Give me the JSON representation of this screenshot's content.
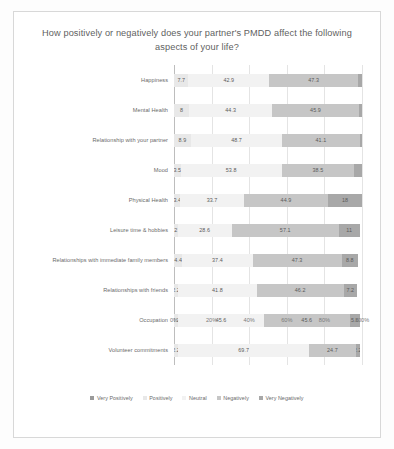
{
  "chart_data": {
    "type": "bar",
    "subtype": "stacked-horizontal-100",
    "title": "How positively or negatively does your partner's PMDD affect the following aspects of your life?",
    "xlabel": "",
    "ylabel": "",
    "xlim": [
      0,
      100
    ],
    "grid": true,
    "legend_position": "bottom",
    "xticks": [
      "0%",
      "20%",
      "40%",
      "60%",
      "80%",
      "100%"
    ],
    "xtick_values": [
      0,
      20,
      40,
      60,
      80,
      100
    ],
    "categories": [
      "Happiness",
      "Mental Health",
      "Relationship with your partner",
      "Mood",
      "Physical Health",
      "Leisure time & hobbies",
      "Relationships with immediate family members",
      "Relationships with friends",
      "Occupation",
      "Volunteer commitments"
    ],
    "series": [
      {
        "name": "Very Positively",
        "color": "#9a9a9a",
        "values": [
          0,
          0,
          0,
          0,
          0,
          0,
          0,
          0,
          0,
          0
        ]
      },
      {
        "name": "Positively",
        "color": "#e8e8e8",
        "values": [
          7.7,
          8,
          8.9,
          3.5,
          3.4,
          2,
          4.4,
          2.2,
          2.2,
          2.2
        ]
      },
      {
        "name": "Neutral",
        "color": "#f2f2f2",
        "values": [
          42.9,
          44.3,
          48.7,
          53.8,
          33.7,
          28.6,
          37.4,
          41.8,
          45.6,
          69.7
        ]
      },
      {
        "name": "Negatively",
        "color": "#c6c6c6",
        "values": [
          47.3,
          45.9,
          41.1,
          38.5,
          44.9,
          57.1,
          47.3,
          46.2,
          45.6,
          24.7
        ]
      },
      {
        "name": "Very Negatively",
        "color": "#a8a8a8",
        "values": [
          2.1,
          1.8,
          1.3,
          4.2,
          18,
          11,
          8.8,
          7.2,
          5.6,
          2.2
        ]
      }
    ],
    "data_labels": [
      {
        "category": "Happiness",
        "labels": [
          "7.7",
          "42.9",
          "47.3"
        ]
      },
      {
        "category": "Mental Health",
        "labels": [
          "8",
          "44.3",
          "45.9"
        ]
      },
      {
        "category": "Relationship with your partner",
        "labels": [
          "8.9",
          "48.7",
          "41.1"
        ]
      },
      {
        "category": "Mood",
        "labels": [
          "3.5",
          "53.8",
          "38.5"
        ]
      },
      {
        "category": "Physical Health",
        "labels": [
          "3.4",
          "33.7",
          "44.9",
          "18"
        ]
      },
      {
        "category": "Leisure time & hobbies",
        "labels": [
          "2",
          "28.6",
          "57.1",
          "11"
        ]
      },
      {
        "category": "Relationships with immediate family members",
        "labels": [
          "4.4",
          "37.4",
          "47.3",
          "8.8"
        ]
      },
      {
        "category": "Relationships with friends",
        "labels": [
          "2.2",
          "41.8",
          "46.2",
          "7.2"
        ]
      },
      {
        "category": "Occupation",
        "labels": [
          "2.2",
          "45.6",
          "45.6",
          "5.6"
        ]
      },
      {
        "category": "Volunteer commitments",
        "labels": [
          "2.2",
          "69.7",
          "24.7",
          "2.2"
        ]
      }
    ],
    "rows": [
      {
        "label": "Happiness",
        "segments": [
          {
            "series": "Positively",
            "value": 7.7,
            "label": "7.7",
            "cls": "seg1"
          },
          {
            "series": "Neutral",
            "value": 42.9,
            "label": "42.9",
            "cls": "seg2"
          },
          {
            "series": "Negatively",
            "value": 47.3,
            "label": "47.3",
            "cls": "seg3"
          },
          {
            "series": "Very Negatively",
            "value": 2.1,
            "label": "",
            "cls": "seg4"
          }
        ]
      },
      {
        "label": "Mental Health",
        "segments": [
          {
            "series": "Positively",
            "value": 8,
            "label": "8",
            "cls": "seg1"
          },
          {
            "series": "Neutral",
            "value": 44.3,
            "label": "44.3",
            "cls": "seg2"
          },
          {
            "series": "Negatively",
            "value": 45.9,
            "label": "45.9",
            "cls": "seg3"
          },
          {
            "series": "Very Negatively",
            "value": 1.8,
            "label": "",
            "cls": "seg4"
          }
        ]
      },
      {
        "label": "Relationship with your partner",
        "segments": [
          {
            "series": "Positively",
            "value": 8.9,
            "label": "8.9",
            "cls": "seg1"
          },
          {
            "series": "Neutral",
            "value": 48.7,
            "label": "48.7",
            "cls": "seg2"
          },
          {
            "series": "Negatively",
            "value": 41.1,
            "label": "41.1",
            "cls": "seg3"
          },
          {
            "series": "Very Negatively",
            "value": 1.3,
            "label": "",
            "cls": "seg4"
          }
        ]
      },
      {
        "label": "Mood",
        "segments": [
          {
            "series": "Positively",
            "value": 3.5,
            "label": "3.5",
            "cls": "seg1"
          },
          {
            "series": "Neutral",
            "value": 53.8,
            "label": "53.8",
            "cls": "seg2"
          },
          {
            "series": "Negatively",
            "value": 38.5,
            "label": "38.5",
            "cls": "seg3"
          },
          {
            "series": "Very Negatively",
            "value": 4.2,
            "label": "",
            "cls": "seg4"
          }
        ]
      },
      {
        "label": "Physical Health",
        "segments": [
          {
            "series": "Positively",
            "value": 3.4,
            "label": "3.4",
            "cls": "seg1"
          },
          {
            "series": "Neutral",
            "value": 33.7,
            "label": "33.7",
            "cls": "seg2"
          },
          {
            "series": "Negatively",
            "value": 44.9,
            "label": "44.9",
            "cls": "seg3"
          },
          {
            "series": "Very Negatively",
            "value": 18,
            "label": "18",
            "cls": "seg4"
          }
        ]
      },
      {
        "label": "Leisure time & hobbies",
        "segments": [
          {
            "series": "Positively",
            "value": 2,
            "label": "2",
            "cls": "seg1"
          },
          {
            "series": "Neutral",
            "value": 28.6,
            "label": "28.6",
            "cls": "seg2"
          },
          {
            "series": "Negatively",
            "value": 57.1,
            "label": "57.1",
            "cls": "seg3"
          },
          {
            "series": "Very Negatively",
            "value": 11,
            "label": "11",
            "cls": "seg4"
          }
        ]
      },
      {
        "label": "Relationships with immediate family members",
        "segments": [
          {
            "series": "Positively",
            "value": 4.4,
            "label": "4.4",
            "cls": "seg1"
          },
          {
            "series": "Neutral",
            "value": 37.4,
            "label": "37.4",
            "cls": "seg2"
          },
          {
            "series": "Negatively",
            "value": 47.3,
            "label": "47.3",
            "cls": "seg3"
          },
          {
            "series": "Very Negatively",
            "value": 8.8,
            "label": "8.8",
            "cls": "seg4"
          }
        ]
      },
      {
        "label": "Relationships with friends",
        "segments": [
          {
            "series": "Positively",
            "value": 2.2,
            "label": "2.2",
            "cls": "seg1"
          },
          {
            "series": "Neutral",
            "value": 41.8,
            "label": "41.8",
            "cls": "seg2"
          },
          {
            "series": "Negatively",
            "value": 46.2,
            "label": "46.2",
            "cls": "seg3"
          },
          {
            "series": "Very Negatively",
            "value": 7.2,
            "label": "7.2",
            "cls": "seg4"
          }
        ]
      },
      {
        "label": "Occupation",
        "segments": [
          {
            "series": "Positively",
            "value": 2.2,
            "label": "2.2",
            "cls": "seg1"
          },
          {
            "series": "Neutral",
            "value": 45.6,
            "label": "45.6",
            "cls": "seg2"
          },
          {
            "series": "Negatively",
            "value": 45.6,
            "label": "45.6",
            "cls": "seg3"
          },
          {
            "series": "Very Negatively",
            "value": 5.6,
            "label": "5.6",
            "cls": "seg4"
          }
        ]
      },
      {
        "label": "Volunteer commitments",
        "segments": [
          {
            "series": "Positively",
            "value": 2.2,
            "label": "2.2",
            "cls": "seg1"
          },
          {
            "series": "Neutral",
            "value": 69.7,
            "label": "69.7",
            "cls": "seg2"
          },
          {
            "series": "Negatively",
            "value": 24.7,
            "label": "24.7",
            "cls": "seg3"
          },
          {
            "series": "Very Negatively",
            "value": 2.2,
            "label": "2.2",
            "cls": "seg4"
          }
        ]
      }
    ],
    "legend": [
      {
        "label": "Very Positively",
        "cls": "seg0"
      },
      {
        "label": "Positively",
        "cls": "seg1"
      },
      {
        "label": "Neutral",
        "cls": "seg2"
      },
      {
        "label": "Negatively",
        "cls": "seg3"
      },
      {
        "label": "Very Negatively",
        "cls": "seg4"
      }
    ]
  }
}
